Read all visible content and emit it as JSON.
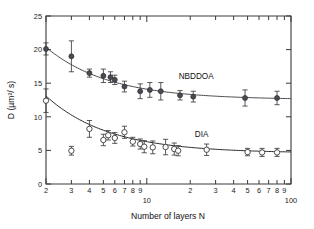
{
  "figure": {
    "background": "#ffffff",
    "frame_color": "#3a3a3a"
  },
  "chart_data": {
    "type": "scatter",
    "title": "",
    "xlabel": "Number of layers N",
    "ylabel": "D (µm²/ s)",
    "xscale": "log",
    "yscale": "linear",
    "xlim": [
      2,
      100
    ],
    "ylim": [
      0,
      25
    ],
    "grid": false,
    "legend_position": "inline-annotation",
    "y_ticks": [
      0,
      5,
      10,
      15,
      20,
      25
    ],
    "y_tick_labels": [
      "0",
      "5",
      "10",
      "15",
      "20",
      "25"
    ],
    "x_ticks": [
      2,
      3,
      4,
      5,
      6,
      7,
      8,
      9,
      10,
      20,
      30,
      40,
      50,
      60,
      70,
      80,
      90,
      100
    ],
    "x_tick_labels": [
      "2",
      "3",
      "4",
      "5",
      "6",
      "7",
      "8",
      "9",
      "10",
      "2",
      "3",
      "4",
      "5",
      "6",
      "7",
      "8",
      "9",
      "100"
    ],
    "annotations": [
      {
        "text": "NBDDOA",
        "x": 22,
        "y": 15.6
      },
      {
        "text": "DIA",
        "x": 24,
        "y": 7.0
      }
    ],
    "series": [
      {
        "name": "NBDDOA",
        "marker": "filled-circle",
        "color": "#4a4a52",
        "x": [
          2.0,
          3.0,
          4.0,
          5.0,
          5.6,
          6.0,
          7.0,
          9.0,
          10.5,
          12.5,
          17.0,
          21.0,
          48.0,
          80.0
        ],
        "y": [
          20.1,
          19.0,
          16.5,
          16.1,
          15.9,
          15.5,
          14.5,
          13.8,
          14.0,
          13.8,
          13.2,
          13.0,
          12.8,
          12.8
        ],
        "yerr": [
          0.9,
          2.3,
          0.6,
          1.0,
          0.8,
          0.7,
          0.8,
          1.1,
          1.1,
          1.3,
          0.7,
          0.8,
          1.2,
          1.0
        ],
        "fit": {
          "model": "D = D_inf + A / N",
          "D_inf": 12.55,
          "A": 15.6
        }
      },
      {
        "name": "DIA",
        "marker": "open-circle",
        "color": "#2e2e34",
        "x": [
          2.0,
          3.0,
          4.0,
          5.0,
          5.4,
          6.0,
          7.0,
          8.0,
          9.0,
          9.6,
          11.0,
          13.5,
          15.5,
          16.5,
          26.0,
          50.0,
          63.0,
          80.0
        ],
        "y": [
          12.4,
          4.95,
          8.2,
          6.55,
          7.25,
          6.85,
          7.7,
          6.3,
          5.95,
          5.55,
          5.45,
          5.5,
          5.2,
          4.95,
          5.1,
          4.75,
          4.7,
          4.7
        ],
        "yerr": [
          1.75,
          0.65,
          1.25,
          0.85,
          0.7,
          0.8,
          0.9,
          0.65,
          0.75,
          0.9,
          0.95,
          1.15,
          0.9,
          0.75,
          0.85,
          0.55,
          0.6,
          0.6
        ],
        "fit": {
          "model": "D = D_inf + A / N",
          "D_inf": 4.6,
          "A": 17.0
        }
      }
    ]
  }
}
